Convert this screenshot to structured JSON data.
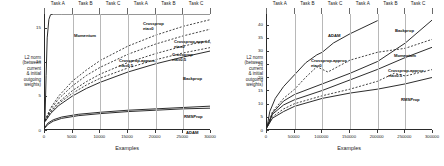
{
  "figure": {
    "panels": [
      {
        "id": "left",
        "ylabel": "L2 norm\n(between\ncurrent\n& initial\noutgoing\nweights)",
        "xlabel": "Examples",
        "xticks": [
          "0",
          "5000",
          "10000",
          "15000",
          "20000",
          "25000",
          "30000"
        ],
        "yticks": [
          "0",
          "5",
          "10",
          "15"
        ],
        "xlim": [
          0,
          30000
        ],
        "ylim": [
          0,
          17
        ],
        "task_headers": [
          "Task A",
          "Task B",
          "Task C",
          "Task A",
          "Task B",
          "Task C"
        ],
        "curve_labels": [
          {
            "text": "Momentum",
            "x": 30,
            "y": 20
          },
          {
            "text": "Crossprop\neta=0",
            "x": 99,
            "y": 8
          },
          {
            "text": "Crossprop-approx,\neta=0",
            "x": 130,
            "y": 26
          },
          {
            "text": "Crossprop\neta=0.5",
            "x": 128,
            "y": 39
          },
          {
            "text": "Crossprop-approx,\neta=0.5",
            "x": 75,
            "y": 45
          },
          {
            "text": "Backprop",
            "x": 139,
            "y": 63
          },
          {
            "text": "RMSProp",
            "x": 140,
            "y": 101
          },
          {
            "text": "ADAM",
            "x": 142,
            "y": 117
          }
        ]
      },
      {
        "id": "right",
        "ylabel": "L2 norm\n(between\ncurrent\n& initial\noutgoing\nweights)",
        "xlabel": "Examples",
        "xticks": [
          "0",
          "50000",
          "100000",
          "150000",
          "200000",
          "250000",
          "300000"
        ],
        "yticks": [
          "0",
          "5",
          "10",
          "15",
          "20",
          "25",
          "30",
          "35",
          "40"
        ],
        "xlim": [
          0,
          300000
        ],
        "ylim": [
          0,
          44
        ],
        "task_headers": [
          "Task A",
          "Task B",
          "Task C",
          "Task A",
          "Task B",
          "Task C"
        ],
        "curve_labels": [
          {
            "text": "ADAM",
            "x": 62,
            "y": 20
          },
          {
            "text": "Backprop",
            "x": 129,
            "y": 15
          },
          {
            "text": "Momentum",
            "x": 128,
            "y": 40
          },
          {
            "text": "Crossprop-approx,\neta=0",
            "x": 45,
            "y": 45
          },
          {
            "text": "Crossprop-approx,\neta=0.5",
            "x": 122,
            "y": 55
          },
          {
            "text": "RMSProp",
            "x": 135,
            "y": 84
          }
        ]
      }
    ]
  },
  "chart_data": [
    {
      "type": "line",
      "panel": "left",
      "title": "",
      "xlabel": "Examples",
      "ylabel": "L2 norm (between current & initial outgoing weights)",
      "xlim": [
        0,
        30000
      ],
      "ylim": [
        0,
        17
      ],
      "xticks": [
        0,
        5000,
        10000,
        15000,
        20000,
        25000,
        30000
      ],
      "yticks": [
        0,
        5,
        10,
        15
      ],
      "grid": "vertical-task-boundaries",
      "task_boundaries": [
        0,
        5000,
        10000,
        15000,
        20000,
        25000,
        30000
      ],
      "task_headers": [
        "Task A",
        "Task B",
        "Task C",
        "Task A",
        "Task B",
        "Task C"
      ],
      "legend": "inline-annotations",
      "series": [
        {
          "name": "Momentum",
          "style": "solid",
          "x": [
            0,
            200,
            400,
            700,
            1000,
            1500,
            2000,
            3000,
            5000,
            10000,
            20000,
            30000
          ],
          "values": [
            1.5,
            8.0,
            13.5,
            16.2,
            16.9,
            17.0,
            17.0,
            17.0,
            17.0,
            17.0,
            17.0,
            17.0
          ]
        },
        {
          "name": "Crossprop, eta=0",
          "style": "dashed",
          "x": [
            0,
            1000,
            2500,
            5000,
            7500,
            10000,
            15000,
            20000,
            25000,
            30000
          ],
          "values": [
            1.4,
            3.2,
            5.0,
            7.2,
            8.8,
            10.2,
            12.3,
            13.9,
            15.2,
            16.2
          ]
        },
        {
          "name": "Crossprop-approx, eta=0",
          "style": "dashed",
          "x": [
            0,
            1000,
            2500,
            5000,
            7500,
            10000,
            15000,
            20000,
            25000,
            30000
          ],
          "values": [
            1.4,
            3.0,
            4.6,
            6.5,
            8.0,
            9.2,
            11.1,
            12.6,
            13.8,
            14.8
          ]
        },
        {
          "name": "Crossprop, eta=0.5",
          "style": "dashed",
          "x": [
            0,
            1000,
            2500,
            5000,
            7500,
            10000,
            15000,
            20000,
            25000,
            30000
          ],
          "values": [
            1.3,
            2.7,
            4.1,
            5.8,
            7.1,
            8.2,
            9.9,
            11.2,
            12.3,
            13.2
          ]
        },
        {
          "name": "Crossprop-approx, eta=0.5",
          "style": "dashed",
          "x": [
            0,
            1000,
            2500,
            5000,
            7500,
            10000,
            15000,
            20000,
            25000,
            30000
          ],
          "values": [
            1.3,
            2.6,
            3.9,
            5.4,
            6.6,
            7.6,
            9.1,
            10.3,
            11.3,
            12.1
          ]
        },
        {
          "name": "Backprop",
          "style": "solid",
          "x": [
            0,
            1000,
            2500,
            5000,
            7500,
            10000,
            15000,
            20000,
            25000,
            30000
          ],
          "values": [
            1.2,
            2.4,
            3.6,
            5.0,
            6.1,
            7.0,
            8.5,
            9.7,
            10.7,
            11.6
          ]
        },
        {
          "name": "RMSProp",
          "style": "solid",
          "x": [
            0,
            500,
            1500,
            3000,
            6000,
            10000,
            15000,
            20000,
            25000,
            30000
          ],
          "values": [
            0.4,
            1.0,
            1.5,
            1.9,
            2.3,
            2.6,
            2.9,
            3.1,
            3.3,
            3.5
          ]
        },
        {
          "name": "ADAM",
          "style": "solid",
          "x": [
            0,
            500,
            1500,
            3000,
            6000,
            10000,
            15000,
            20000,
            25000,
            30000
          ],
          "values": [
            0.3,
            0.8,
            1.3,
            1.7,
            2.1,
            2.4,
            2.7,
            2.9,
            3.1,
            3.2
          ]
        }
      ]
    },
    {
      "type": "line",
      "panel": "right",
      "title": "",
      "xlabel": "Examples",
      "ylabel": "L2 norm (between current & initial outgoing weights)",
      "xlim": [
        0,
        300000
      ],
      "ylim": [
        0,
        44
      ],
      "xticks": [
        0,
        50000,
        100000,
        150000,
        200000,
        250000,
        300000
      ],
      "yticks": [
        0,
        5,
        10,
        15,
        20,
        25,
        30,
        35,
        40
      ],
      "grid": "vertical-task-boundaries",
      "task_boundaries": [
        0,
        50000,
        100000,
        150000,
        200000,
        250000,
        300000
      ],
      "task_headers": [
        "Task A",
        "Task B",
        "Task C",
        "Task A",
        "Task B",
        "Task C"
      ],
      "legend": "inline-annotations",
      "series": [
        {
          "name": "ADAM",
          "style": "solid",
          "x": [
            0,
            5000,
            15000,
            30000,
            50000,
            70000,
            90000,
            100000,
            120000,
            150000,
            170000,
            200000
          ],
          "values": [
            1.0,
            7.0,
            12.0,
            16.5,
            21.0,
            25.5,
            28.5,
            29.5,
            33.0,
            36.5,
            38.5,
            41.5
          ]
        },
        {
          "name": "Backprop",
          "style": "solid",
          "x": [
            0,
            10000,
            30000,
            50000,
            100000,
            150000,
            200000,
            250000,
            300000
          ],
          "values": [
            1.0,
            6.5,
            11.0,
            13.5,
            17.5,
            21.5,
            26.0,
            33.0,
            42.0
          ]
        },
        {
          "name": "Momentum",
          "style": "solid",
          "x": [
            0,
            10000,
            30000,
            50000,
            100000,
            150000,
            200000,
            250000,
            300000
          ],
          "values": [
            1.0,
            6.0,
            9.5,
            11.5,
            15.0,
            19.0,
            23.0,
            27.5,
            31.5
          ]
        },
        {
          "name": "Crossprop-approx, eta=0",
          "style": "dashed",
          "x": [
            0,
            10000,
            30000,
            50000,
            70000,
            90000,
            100000,
            110000,
            150000,
            200000,
            250000,
            300000
          ],
          "values": [
            1.0,
            7.0,
            12.0,
            15.5,
            20.0,
            24.0,
            23.0,
            22.0,
            26.5,
            29.5,
            31.0,
            34.5
          ]
        },
        {
          "name": "Crossprop-approx, eta=0.5",
          "style": "dashed",
          "x": [
            0,
            10000,
            30000,
            50000,
            100000,
            150000,
            200000,
            230000,
            250000,
            300000
          ],
          "values": [
            1.0,
            5.0,
            8.0,
            10.0,
            13.0,
            15.5,
            18.5,
            21.5,
            20.5,
            23.0
          ]
        },
        {
          "name": "RMSProp",
          "style": "solid",
          "x": [
            0,
            10000,
            30000,
            50000,
            100000,
            150000,
            200000,
            250000,
            300000
          ],
          "values": [
            1.0,
            4.5,
            7.0,
            9.0,
            12.0,
            14.0,
            15.5,
            17.5,
            20.0
          ]
        }
      ]
    }
  ]
}
